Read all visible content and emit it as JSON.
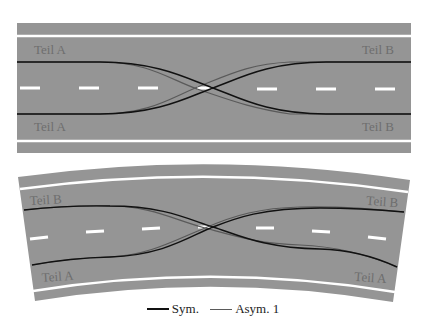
{
  "colors": {
    "road": "#959595",
    "marking": "#ffffff",
    "sym_line": "#111111",
    "asym_line": "#5a5a5a",
    "label": "#6e6e6e"
  },
  "straight_road": {
    "labels": {
      "top_left": "Teil A",
      "bottom_left": "Teil A",
      "top_right": "Teil B",
      "bottom_right": "Teil B"
    }
  },
  "curved_road": {
    "labels": {
      "top_left": "Teil B",
      "bottom_left": "Teil A",
      "top_right": "Teil B",
      "bottom_right": "Teil A"
    }
  },
  "legend": {
    "items": [
      {
        "label": "Sym.",
        "color": "#111111"
      },
      {
        "label": "Asym. 1",
        "color": "#5a5a5a"
      }
    ]
  }
}
